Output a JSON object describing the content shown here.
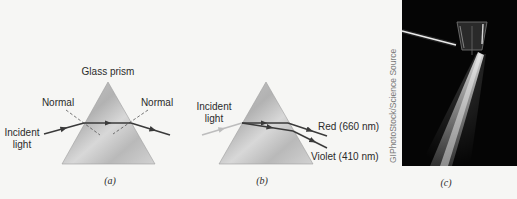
{
  "panels": [
    {
      "id": "a",
      "label": "(a)",
      "title": "Glass prism",
      "normal_left": "Normal",
      "normal_right": "Normal",
      "incident_line1": "Incident",
      "incident_line2": "light"
    },
    {
      "id": "b",
      "label": "(b)",
      "incident_line1": "Incident",
      "incident_line2": "light",
      "ray_red": "Red (660 nm)",
      "ray_violet": "Violet (410 nm)"
    },
    {
      "id": "c",
      "label": "(c)",
      "photo_credit": "GIPhotoStock/Science Source"
    }
  ],
  "colors": {
    "background": "#f6f6f4",
    "prism_fill_light": "#dcdcdc",
    "prism_fill_dark": "#a9a9a9",
    "ray": "#3a3a3a",
    "incident_b": "#bdbdbd",
    "photo_bg": "#050505"
  }
}
